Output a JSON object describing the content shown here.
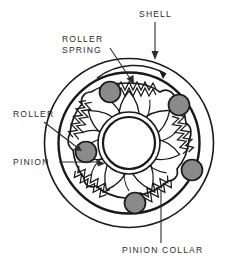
{
  "figure": {
    "background_color": "#ffffff",
    "line_color": "#1a1a1a",
    "roller_fill": "#8a8a8a",
    "text_color": "#2b2b2b"
  },
  "labels": [
    {
      "id": "shell",
      "text": "SHELL",
      "x": 139,
      "y": 17,
      "leader": "vertical-arrow-down",
      "points_to": "outer-shell-ring"
    },
    {
      "id": "roller-spring",
      "text_lines": [
        "ROLLER",
        "SPRING"
      ],
      "line1": "ROLLER",
      "line2": "SPRING",
      "x": 62,
      "y": 42,
      "leader": "diagonal-arrow-down-right",
      "points_to": "spring-coil-top"
    },
    {
      "id": "roller",
      "text": "ROLLER",
      "x": 13,
      "y": 117,
      "leader": "diagonal-arrow-down-right",
      "points_to": "roller-left"
    },
    {
      "id": "pinion",
      "text": "PINION",
      "x": 13,
      "y": 165,
      "leader": "horizontal-arrow-right",
      "points_to": "pinion-gear-teeth"
    },
    {
      "id": "pinion-collar",
      "text": "PINION COLLAR",
      "x": 122,
      "y": 253,
      "leader": "vertical-line-up",
      "points_to": "pinion-collar-lobe"
    }
  ],
  "parts": {
    "shell": {
      "name": "shell",
      "outer_radius": 84,
      "inner_radius": 70,
      "center_x": 129,
      "center_y": 143
    },
    "pinion_collar": {
      "name": "pinion-collar",
      "lobe_count": 7,
      "radius": 56
    },
    "pinion": {
      "name": "pinion",
      "bore_outer_radius": 30,
      "bore_inner_radius": 25
    },
    "rollers": {
      "name": "roller",
      "count": 5,
      "radius": 10,
      "fill": "#8a8a8a"
    },
    "springs": {
      "name": "roller-spring",
      "count": 5,
      "type": "coil-zigzag"
    },
    "rotation_arrow": {
      "name": "rotation-direction-arrow",
      "direction": "clockwise"
    }
  }
}
